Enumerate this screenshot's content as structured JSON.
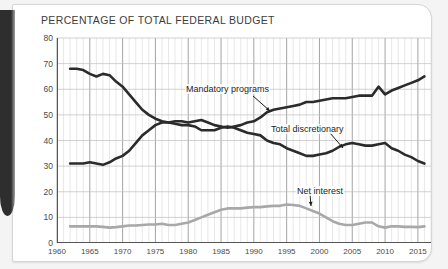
{
  "card": {
    "title": "PERCENTAGE OF TOTAL FEDERAL BUDGET"
  },
  "chart_data": {
    "type": "line",
    "title": "PERCENTAGE OF TOTAL FEDERAL BUDGET",
    "xlabel": "",
    "ylabel": "",
    "xlim": [
      1960,
      2017
    ],
    "ylim": [
      0,
      80
    ],
    "grid": true,
    "legend_position": "inline-annotations",
    "ytick_labels": [
      "0",
      "10",
      "20",
      "30",
      "40",
      "50",
      "60",
      "70",
      "80"
    ],
    "yticks": [
      0,
      10,
      20,
      30,
      40,
      50,
      60,
      70,
      80
    ],
    "xtick_labels": [
      "1960",
      "1965",
      "1970",
      "1975",
      "1980",
      "1985",
      "1990",
      "1995",
      "2000",
      "2005",
      "2010",
      "2015"
    ],
    "xticks": [
      1960,
      1965,
      1970,
      1975,
      1980,
      1985,
      1990,
      1995,
      2000,
      2005,
      2010,
      2015
    ],
    "x": [
      1962,
      1963,
      1964,
      1965,
      1966,
      1967,
      1968,
      1969,
      1970,
      1971,
      1972,
      1973,
      1974,
      1975,
      1976,
      1977,
      1978,
      1979,
      1980,
      1981,
      1982,
      1983,
      1984,
      1985,
      1986,
      1987,
      1988,
      1989,
      1990,
      1991,
      1992,
      1993,
      1994,
      1995,
      1996,
      1997,
      1998,
      1999,
      2000,
      2001,
      2002,
      2003,
      2004,
      2005,
      2006,
      2007,
      2008,
      2009,
      2010,
      2011,
      2012,
      2013,
      2014,
      2015,
      2016
    ],
    "series": [
      {
        "name": "Total discretionary",
        "color": "#2b2b2b",
        "annotation": "Total discretionary",
        "values": [
          68,
          68,
          67.5,
          66,
          65,
          66,
          65.5,
          63,
          61,
          58,
          55,
          52,
          50,
          48.5,
          47.5,
          47,
          46.5,
          46,
          46,
          45.5,
          44,
          44,
          44,
          45,
          45.5,
          45,
          44,
          43,
          42.5,
          42,
          40,
          39,
          38.5,
          37,
          36,
          35,
          34,
          34,
          34.5,
          35,
          36,
          37.5,
          38.5,
          39,
          38.5,
          38,
          38,
          38.5,
          39,
          37,
          36,
          34.5,
          33.5,
          32,
          31
        ]
      },
      {
        "name": "Mandatory programs",
        "color": "#2b2b2b",
        "annotation": "Mandatory programs",
        "values": [
          31,
          31,
          31,
          31.5,
          31,
          30.5,
          31.5,
          33,
          34,
          36,
          39,
          42,
          44,
          46,
          47,
          47,
          47.5,
          47.5,
          47,
          47.5,
          48,
          47,
          46,
          45.5,
          45,
          45.5,
          46,
          47,
          47.5,
          49,
          51,
          52,
          52.5,
          53,
          53.5,
          54,
          55,
          55,
          55.5,
          56,
          56.5,
          56.5,
          56.5,
          57,
          57.5,
          57.5,
          57.5,
          61,
          58,
          59.5,
          60.5,
          61.5,
          62.5,
          63.5,
          65
        ]
      },
      {
        "name": "Net interest",
        "color": "#a8a8a8",
        "annotation": "Net interest",
        "values": [
          6.5,
          6.5,
          6.5,
          6.5,
          6.5,
          6.3,
          6,
          6.2,
          6.5,
          6.8,
          6.8,
          7,
          7.2,
          7.2,
          7.5,
          7,
          7,
          7.5,
          8,
          9,
          10,
          11,
          12,
          13,
          13.5,
          13.5,
          13.5,
          13.8,
          14,
          14,
          14.3,
          14.5,
          14.5,
          15,
          14.8,
          14.5,
          13.5,
          12.5,
          11.5,
          10,
          8.5,
          7.5,
          7,
          7,
          7.5,
          8,
          8,
          6.5,
          6,
          6.5,
          6.5,
          6.3,
          6.3,
          6.2,
          6.5
        ]
      }
    ]
  }
}
